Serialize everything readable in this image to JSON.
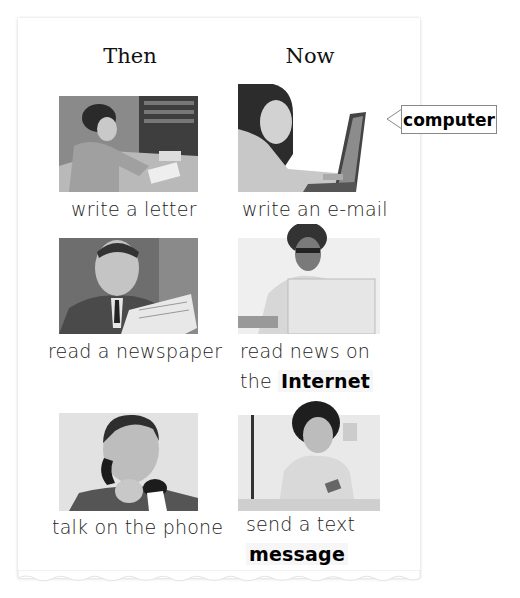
{
  "headers": {
    "then": "Then",
    "now": "Now"
  },
  "callout": {
    "label": "computer"
  },
  "rows": [
    {
      "then": {
        "image": "woman-writing-letter-photo",
        "caption": "write a letter"
      },
      "now": {
        "image": "girl-using-laptop-photo",
        "caption": "write an e-mail"
      }
    },
    {
      "then": {
        "image": "man-reading-newspaper-photo",
        "caption": "read a newspaper"
      },
      "now": {
        "image": "woman-reading-laptop-photo",
        "caption_line1": "read news on",
        "caption_line2_prefix": "the",
        "caption_line2_keyword": "Internet"
      }
    },
    {
      "then": {
        "image": "man-on-phone-photo",
        "caption": "talk on the phone"
      },
      "now": {
        "image": "girl-texting-photo",
        "caption_line1": "send a text",
        "caption_line2_keyword": "message"
      }
    }
  ]
}
